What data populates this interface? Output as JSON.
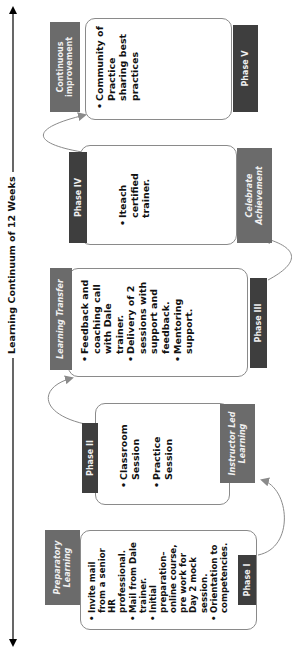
{
  "diagram": {
    "title": "Learning Continuum of 12 Weeks",
    "orientation": "rotated-90-ccw",
    "colors": {
      "category_header": "#6b6b6b",
      "phase_label": "#3e3e3e",
      "card_border": "#8a8a8a",
      "connector": "#8a8a8a",
      "timeline": "#000000"
    },
    "phases": [
      {
        "phase_label": "Phase I",
        "category": "Preparatory Learning",
        "category_italic": true,
        "bullets": [
          "Invite mail from a senior HR professional.",
          "Mail from Dale trainer.",
          "Initial preparation–online course, pre work for Day 2 mock session.",
          "Orientation to competencies."
        ]
      },
      {
        "phase_label": "Phase II",
        "category": "Instructor Led Learning",
        "category_italic": true,
        "bullets": [
          "Classroom Session",
          "Practice Session"
        ]
      },
      {
        "phase_label": "Phase III",
        "category": "Learning Transfer",
        "category_italic": true,
        "bullets": [
          "Feedback and coaching call with Dale trainer.",
          "Delivery of 2 sessions with support and feedback.",
          "Mentoring support."
        ]
      },
      {
        "phase_label": "Phase IV",
        "category": "Celebrate Achievement",
        "category_italic": true,
        "bullets": [
          "Iteach certified trainer."
        ]
      },
      {
        "phase_label": "Phase V",
        "category": "Continuous improvement",
        "category_italic": false,
        "bullets": [
          "Community of Practice sharing best practices"
        ]
      }
    ]
  }
}
